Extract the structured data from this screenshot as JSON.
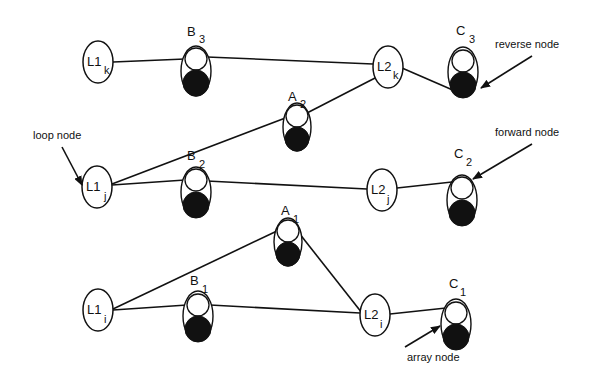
{
  "diagram": {
    "loop_nodes": [
      {
        "id": "L1k",
        "base": "L1",
        "sub": "k",
        "x": 98,
        "y": 62
      },
      {
        "id": "L2k",
        "base": "L2",
        "sub": "k",
        "x": 388,
        "y": 67
      },
      {
        "id": "L1j",
        "base": "L1",
        "sub": "j",
        "x": 97,
        "y": 187
      },
      {
        "id": "L2j",
        "base": "L2",
        "sub": "j",
        "x": 382,
        "y": 190
      },
      {
        "id": "L1i",
        "base": "L1",
        "sub": "i",
        "x": 98,
        "y": 310
      },
      {
        "id": "L2i",
        "base": "L2",
        "sub": "i",
        "x": 375,
        "y": 315
      }
    ],
    "array_nodes": [
      {
        "id": "B3",
        "base": "B",
        "sub": "3",
        "x": 196,
        "y": 70
      },
      {
        "id": "C3",
        "base": "C",
        "sub": "3",
        "x": 464,
        "y": 72
      },
      {
        "id": "A2",
        "base": "A",
        "sub": "2",
        "x": 298,
        "y": 125
      },
      {
        "id": "B2",
        "base": "B",
        "sub": "2",
        "x": 196,
        "y": 190
      },
      {
        "id": "C2",
        "base": "C",
        "sub": "2",
        "x": 462,
        "y": 200
      },
      {
        "id": "A1",
        "base": "A",
        "sub": "1",
        "x": 288,
        "y": 240
      },
      {
        "id": "B1",
        "base": "B",
        "sub": "1",
        "x": 198,
        "y": 316
      },
      {
        "id": "C1",
        "base": "C",
        "sub": "1",
        "x": 456,
        "y": 324
      }
    ],
    "edges": [
      [
        "L1k",
        "B3"
      ],
      [
        "B3",
        "L2k"
      ],
      [
        "L2k",
        "C3"
      ],
      [
        "L1j",
        "A2"
      ],
      [
        "A2",
        "L2k"
      ],
      [
        "L1j",
        "B2"
      ],
      [
        "B2",
        "L2j"
      ],
      [
        "L2j",
        "C2"
      ],
      [
        "L1i",
        "A1"
      ],
      [
        "A1",
        "L2i"
      ],
      [
        "L1i",
        "B1"
      ],
      [
        "B1",
        "L2i"
      ],
      [
        "L2i",
        "C1"
      ]
    ],
    "annotations": {
      "reverse_node": "reverse node",
      "forward_node": "forward node",
      "loop_node": "loop node",
      "array_node": "array node"
    },
    "labels": {
      "L1k": {
        "base": "L1",
        "sub": "k"
      },
      "L2k": {
        "base": "L2",
        "sub": "k"
      },
      "L1j": {
        "base": "L1",
        "sub": "j"
      },
      "L2j": {
        "base": "L2",
        "sub": "j"
      },
      "L1i": {
        "base": "L1",
        "sub": "i"
      },
      "L2i": {
        "base": "L2",
        "sub": "i"
      },
      "B3": {
        "base": "B",
        "sub": "3"
      },
      "C3": {
        "base": "C",
        "sub": "3"
      },
      "A2": {
        "base": "A",
        "sub": "2"
      },
      "B2": {
        "base": "B",
        "sub": "2"
      },
      "C2": {
        "base": "C",
        "sub": "2"
      },
      "A1": {
        "base": "A",
        "sub": "1"
      },
      "B1": {
        "base": "B",
        "sub": "1"
      },
      "C1": {
        "base": "C",
        "sub": "1"
      }
    },
    "colors": {
      "stroke": "#111111",
      "fill_dark": "#111111",
      "background": "#ffffff"
    }
  }
}
